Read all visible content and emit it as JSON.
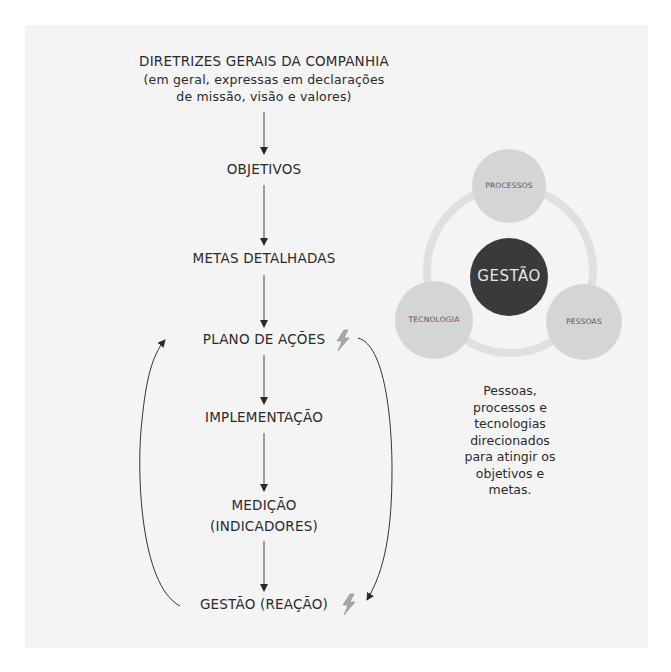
{
  "flow": {
    "header": {
      "title": "DIRETRIZES GERAIS DA COMPANHIA",
      "subtitle_line1": "(em geral, expressas em declarações",
      "subtitle_line2": "de missão, visão e valores)"
    },
    "steps": [
      {
        "label": "OBJETIVOS"
      },
      {
        "label": "METAS DETALHADAS"
      },
      {
        "label": "PLANO DE AÇÕES",
        "icon": "lightning-icon"
      },
      {
        "label": "IMPLEMENTAÇÃO"
      },
      {
        "label_line1": "MEDIÇÃO",
        "label_line2": "(INDICADORES)"
      },
      {
        "label": "GESTÃO (REAÇÃO)",
        "icon": "lightning-icon"
      }
    ],
    "feedback_loop": {
      "left_arrow": "from GESTÃO (REAÇÃO) to PLANO DE AÇÕES",
      "right_arrow": "from PLANO DE AÇÕES to GESTÃO (REAÇÃO)"
    }
  },
  "cycle_diagram": {
    "center": "GESTÃO",
    "nodes": [
      "PROCESSOS",
      "TECNOLOGIA",
      "PESSOAS"
    ],
    "caption_lines": [
      "Pessoas,",
      "processos e",
      "tecnologias",
      "direcionados",
      "para atingir os",
      "objetivos e",
      "metas."
    ]
  },
  "colors": {
    "paper": "#f4f4f4",
    "node_fill": "#d4d4d4",
    "ring": "#e2e2e2",
    "center_fill": "#3a3a3a",
    "lightning": "#9a9a9a",
    "line": "#333333"
  }
}
